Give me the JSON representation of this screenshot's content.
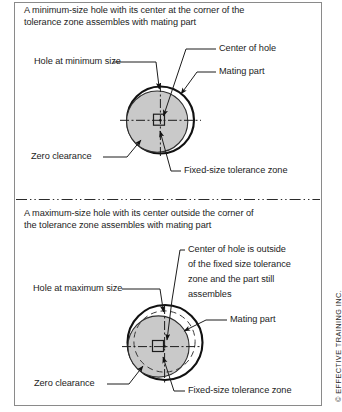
{
  "figure": {
    "kind": "gdt-tolerance-zone-illustration",
    "copyright": "© EFFECTIVE TRAINING INC.",
    "colors": {
      "fill_gray": "#c9c9c9",
      "outline": "#111111",
      "frame": "#8a8a8a",
      "text": "#1c1c1c"
    }
  },
  "panel_top": {
    "title_line1": "A minimum-size hole with its center at the corner of the",
    "title_line2": "tolerance zone assembles with mating part",
    "labels": {
      "hole_at_minimum_size": "Hole at minimum size",
      "center_of_hole": "Center of hole",
      "mating_part": "Mating part",
      "zero_clearance": "Zero clearance",
      "fixed_size_tolerance_zone": "Fixed-size tolerance zone"
    }
  },
  "panel_bottom": {
    "title_line1": "A maximum-size hole with its center outside the corner of",
    "title_line2": "the tolerance zone assembles with mating part",
    "labels": {
      "hole_at_maximum_size": "Hole at maximum size",
      "center_note_line1": "Center of hole is outside",
      "center_note_line2": "of the fixed size tolerance",
      "center_note_line3": "zone and the part still",
      "center_note_line4": "assembles",
      "mating_part": "Mating part",
      "zero_clearance": "Zero clearance",
      "fixed_size_tolerance_zone": "Fixed-size tolerance zone"
    }
  }
}
